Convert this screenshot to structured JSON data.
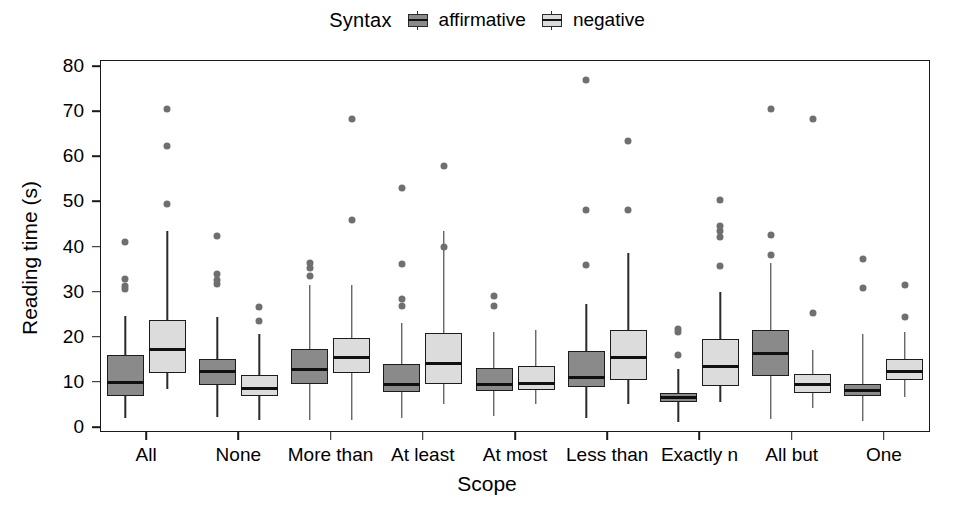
{
  "legend": {
    "title": "Syntax",
    "entries": [
      {
        "label": "affirmative",
        "key": "affirmative",
        "color": "#8a8a8a"
      },
      {
        "label": "negative",
        "key": "negative",
        "color": "#dcdcdc"
      }
    ]
  },
  "axes": {
    "ylabel": "Reading time (s)",
    "xlabel": "Scope",
    "yticks": [
      0,
      10,
      20,
      30,
      40,
      50,
      60,
      70,
      80
    ],
    "ylim": [
      0,
      80
    ]
  },
  "chart_data": {
    "type": "box",
    "title": "",
    "xlabel": "Scope",
    "ylabel": "Reading time (s)",
    "ylim": [
      0,
      80
    ],
    "yticks": [
      0,
      10,
      20,
      30,
      40,
      50,
      60,
      70,
      80
    ],
    "grid": false,
    "legend_title": "Syntax",
    "legend_position": "top-center",
    "categories": [
      "All",
      "None",
      "More than",
      "At least",
      "At most",
      "Less than",
      "Exactly n",
      "All but",
      "One"
    ],
    "series": [
      {
        "name": "affirmative",
        "color": "#8a8a8a",
        "boxes": [
          {
            "category": "All",
            "whisker_low": 2.0,
            "q1": 6.8,
            "median": 9.8,
            "q3": 16.0,
            "whisker_high": 24.6,
            "outliers": [
              30.5,
              31.2,
              32.8,
              41.0
            ]
          },
          {
            "category": "None",
            "whisker_low": 2.2,
            "q1": 9.4,
            "median": 12.2,
            "q3": 15.0,
            "whisker_high": 24.3,
            "outliers": [
              31.8,
              32.6,
              33.8,
              42.3
            ]
          },
          {
            "category": "More than",
            "whisker_low": 1.6,
            "q1": 9.6,
            "median": 12.8,
            "q3": 17.3,
            "whisker_high": 31.5,
            "outliers": [
              33.5,
              35.3,
              36.4
            ]
          },
          {
            "category": "At least",
            "whisker_low": 2.1,
            "q1": 7.8,
            "median": 9.5,
            "q3": 14.0,
            "whisker_high": 23.0,
            "outliers": [
              26.8,
              28.4,
              36.2,
              52.9
            ]
          },
          {
            "category": "At most",
            "whisker_low": 2.4,
            "q1": 8.0,
            "median": 9.4,
            "q3": 13.0,
            "whisker_high": 21.0,
            "outliers": [
              26.8,
              29.0
            ]
          },
          {
            "category": "Less than",
            "whisker_low": 1.9,
            "q1": 8.9,
            "median": 11.0,
            "q3": 16.8,
            "whisker_high": 27.2,
            "outliers": [
              35.8,
              48.0,
              77.0
            ]
          },
          {
            "category": "Exactly n",
            "whisker_low": 1.1,
            "q1": 5.6,
            "median": 6.5,
            "q3": 7.6,
            "whisker_high": 12.8,
            "outliers": [
              16.0,
              21.0,
              21.8
            ]
          },
          {
            "category": "All but",
            "whisker_low": 1.7,
            "q1": 11.2,
            "median": 16.3,
            "q3": 21.6,
            "whisker_high": 36.3,
            "outliers": [
              38.2,
              42.6,
              70.5
            ]
          },
          {
            "category": "One",
            "whisker_low": 1.4,
            "q1": 6.9,
            "median": 8.0,
            "q3": 9.5,
            "whisker_high": 20.5,
            "outliers": [
              30.8,
              37.2
            ]
          }
        ]
      },
      {
        "name": "negative",
        "color": "#dcdcdc",
        "boxes": [
          {
            "category": "All",
            "whisker_low": 8.5,
            "q1": 12.0,
            "median": 17.2,
            "q3": 23.8,
            "whisker_high": 43.5,
            "outliers": [
              49.5,
              62.2,
              70.5
            ]
          },
          {
            "category": "None",
            "whisker_low": 1.6,
            "q1": 6.9,
            "median": 8.5,
            "q3": 11.6,
            "whisker_high": 20.6,
            "outliers": [
              23.6,
              26.7
            ]
          },
          {
            "category": "More than",
            "whisker_low": 1.5,
            "q1": 11.9,
            "median": 15.5,
            "q3": 19.8,
            "whisker_high": 31.4,
            "outliers": [
              45.8,
              68.2
            ]
          },
          {
            "category": "At least",
            "whisker_low": 5.2,
            "q1": 9.6,
            "median": 14.0,
            "q3": 20.8,
            "whisker_high": 43.5,
            "outliers": [
              40.0,
              57.8
            ]
          },
          {
            "category": "At most",
            "whisker_low": 5.2,
            "q1": 8.1,
            "median": 9.6,
            "q3": 13.5,
            "whisker_high": 21.6,
            "outliers": []
          },
          {
            "category": "Less than",
            "whisker_low": 5.0,
            "q1": 10.4,
            "median": 15.3,
            "q3": 21.6,
            "whisker_high": 38.6,
            "outliers": [
              48.0,
              63.4
            ]
          },
          {
            "category": "Exactly n",
            "whisker_low": 5.5,
            "q1": 9.0,
            "median": 13.5,
            "q3": 19.6,
            "whisker_high": 30.0,
            "outliers": [
              35.6,
              42.2,
              43.5,
              44.5,
              50.4
            ]
          },
          {
            "category": "All but",
            "whisker_low": 4.3,
            "q1": 7.5,
            "median": 9.4,
            "q3": 11.8,
            "whisker_high": 17.0,
            "outliers": [
              25.2,
              68.2
            ]
          },
          {
            "category": "One",
            "whisker_low": 6.6,
            "q1": 10.4,
            "median": 12.2,
            "q3": 15.0,
            "whisker_high": 21.0,
            "outliers": [
              24.4,
              31.4
            ]
          }
        ]
      }
    ]
  }
}
